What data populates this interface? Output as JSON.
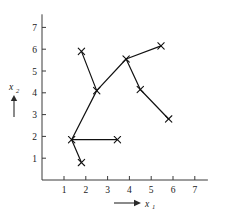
{
  "chart_data": {
    "type": "scatter",
    "title": "",
    "subtitle": "",
    "xlabel": "x",
    "xlabel_sub": "1",
    "ylabel": "x",
    "ylabel_sub": "2",
    "xlim": [
      0,
      7.6
    ],
    "ylim": [
      0,
      7.6
    ],
    "xticks": [
      1,
      2,
      3,
      4,
      5,
      6,
      7
    ],
    "yticks": [
      1,
      2,
      3,
      4,
      5,
      6,
      7
    ],
    "xtick_labels": [
      "1",
      "2",
      "3",
      "4",
      "5",
      "6",
      "7"
    ],
    "ytick_labels": [
      "1",
      "2",
      "3",
      "4",
      "5",
      "6",
      "7"
    ],
    "grid": false,
    "legend": null,
    "marker": "x",
    "points": [
      {
        "id": "p1",
        "x": 1.8,
        "y": 5.9
      },
      {
        "id": "p2",
        "x": 2.5,
        "y": 4.1
      },
      {
        "id": "p3",
        "x": 3.85,
        "y": 5.55
      },
      {
        "id": "p4",
        "x": 5.45,
        "y": 6.15
      },
      {
        "id": "p5",
        "x": 4.5,
        "y": 4.15
      },
      {
        "id": "p6",
        "x": 5.8,
        "y": 2.8
      },
      {
        "id": "p7",
        "x": 1.35,
        "y": 1.85
      },
      {
        "id": "p8",
        "x": 1.8,
        "y": 0.8
      },
      {
        "id": "p9",
        "x": 3.45,
        "y": 1.85
      }
    ],
    "edges": [
      {
        "from": "p1",
        "to": "p2"
      },
      {
        "from": "p2",
        "to": "p3"
      },
      {
        "from": "p3",
        "to": "p4"
      },
      {
        "from": "p3",
        "to": "p5"
      },
      {
        "from": "p5",
        "to": "p6"
      },
      {
        "from": "p2",
        "to": "p7"
      },
      {
        "from": "p7",
        "to": "p8"
      },
      {
        "from": "p7",
        "to": "p9"
      }
    ],
    "annotations": [
      {
        "name": "x-axis-arrow",
        "kind": "arrow",
        "direction": "right"
      },
      {
        "name": "y-axis-arrow",
        "kind": "arrow",
        "direction": "up"
      }
    ]
  }
}
